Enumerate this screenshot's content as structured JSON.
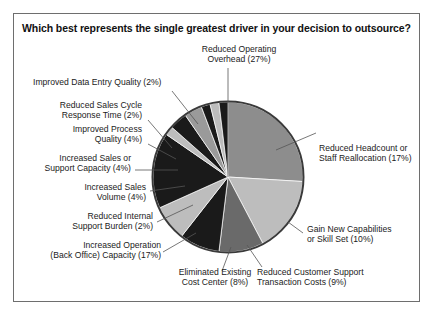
{
  "panel": {
    "title": "Which best represents the single greatest driver in your decision to outsource?",
    "border_color": "#6e6e6e",
    "background": "#ffffff"
  },
  "chart_data": {
    "type": "pie",
    "title": "Which best represents the single greatest driver in your decision to outsource?",
    "xlabel": "",
    "ylabel": "",
    "legend_position": "none",
    "labels_with_leader_lines": true,
    "start_angle_deg": 0,
    "direction": "clockwise",
    "units": "percent",
    "categories": [
      "Reduced Operating Overhead",
      "Reduced Headcount or Staff Reallocation",
      "Gain New Capabilities or Skill Set",
      "Reduced Customer Support Transaction Costs",
      "Eliminated Existing Cost Center",
      "Increased Operation (Back Office) Capacity",
      "Reduced Internal Support Burden",
      "Increased Sales Volume",
      "Increased Sales or Support Capacity",
      "Improved Process Quality",
      "Reduced Sales Cycle Response Time",
      "Improved Data Entry Quality"
    ],
    "values": [
      27,
      17,
      10,
      9,
      8,
      17,
      2,
      4,
      4,
      2,
      2,
      2
    ],
    "slice_colors": [
      "#8d8d8d",
      "#bdbdbd",
      "#6a6a6a",
      "#1a1a1a",
      "#bdbdbd",
      "#1a1a1a",
      "#bdbdbd",
      "#1a1a1a",
      "#9a9a9a",
      "#1a1a1a",
      "#bdbdbd",
      "#1a1a1a"
    ],
    "outline_color": "#3a3a3a"
  },
  "labels": {
    "l0": {
      "line1": "Reduced Operating",
      "line2": "Overhead (27%)"
    },
    "l1": {
      "line1": "Reduced Headcount or",
      "line2": "Staff Reallocation (17%)"
    },
    "l2": {
      "line1": "Gain New Capabilities",
      "line2": "or Skill Set (10%)"
    },
    "l3": {
      "line1": "Reduced Customer Support",
      "line2": "Transaction Costs (9%)"
    },
    "l4": {
      "line1": "Eliminated Existing",
      "line2": "Cost Center (8%)"
    },
    "l5": {
      "line1": "Increased Operation",
      "line2": "(Back Office) Capacity (17%)"
    },
    "l6": {
      "line1": "Reduced Internal",
      "line2": "Support Burden (2%)"
    },
    "l7": {
      "line1": "Increased Sales",
      "line2": "Volume (4%)"
    },
    "l8": {
      "line1": "Increased Sales or",
      "line2": "Support Capacity (4%)"
    },
    "l9": {
      "line1": "Improved Process",
      "line2": "Quality (4%)"
    },
    "l10": {
      "line1": "Reduced Sales Cycle",
      "line2": "Response Time (2%)"
    },
    "l11": {
      "line1": "Improved Data Entry Quality (2%)",
      "line2": ""
    }
  }
}
